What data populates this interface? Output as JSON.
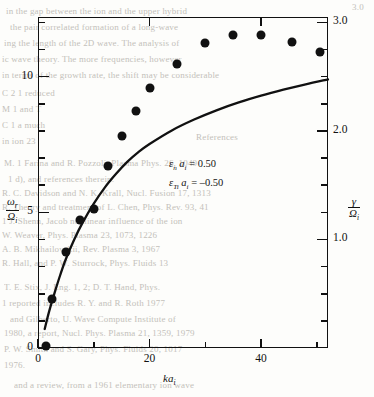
{
  "figure": {
    "background_color": "#fdfdfb",
    "ink_color": "#111111",
    "ghost_color": "#b9b6b0"
  },
  "annotations": {
    "line1": "εₙ aᵢ = 0.50",
    "line1_symbol": "ε",
    "line1_sub": "n",
    "line1_var": "a",
    "line1_var_sub": "i",
    "line1_value": "= 0.50",
    "line2_symbol": "ε",
    "line2_sub": "Ti",
    "line2_var": "a",
    "line2_var_sub": "i",
    "line2_value": "= –0.50"
  },
  "axes": {
    "x": {
      "label_var": "ka",
      "label_sub": "i",
      "label_text": "kaᵢ",
      "min": 0,
      "max": 52,
      "ticks_major": [
        0,
        20,
        40
      ],
      "tick_labels": [
        "0",
        "20",
        "40"
      ],
      "ticks_minor": [
        10,
        30,
        50
      ]
    },
    "y_left": {
      "num": "ω",
      "num_sub": "r",
      "den": "Ω",
      "den_sub": "i",
      "label_text": "ω_r / Ω_i",
      "min": 0,
      "max": 12.2,
      "ticks_major": [
        0,
        5,
        10
      ],
      "tick_labels": [
        "0",
        "5",
        "10"
      ],
      "ticks_minor": [
        1,
        2,
        3,
        4,
        6,
        7,
        8,
        9,
        11,
        12
      ]
    },
    "y_right": {
      "num": "γ",
      "den": "Ω",
      "den_sub": "i",
      "label_text": "γ / Ω_i",
      "min": 0,
      "max": 3.05,
      "ticks_major": [
        1.0,
        2.0,
        3.0
      ],
      "tick_labels": [
        "1.0",
        "2.0",
        "3.0"
      ],
      "ticks_minor": [
        0.25,
        0.5,
        0.75,
        1.25,
        1.5,
        1.75,
        2.25,
        2.5,
        2.75
      ]
    }
  },
  "chart_data": {
    "type": "scatter",
    "title": "",
    "xlabel": "kaᵢ",
    "ylabel": "ω_r / Ω_i",
    "ylabel_right": "γ / Ω_i",
    "xlim": [
      0,
      52
    ],
    "ylim": [
      0,
      12.2
    ],
    "ylim_right": [
      0,
      3.05
    ],
    "grid": false,
    "legend": "none",
    "series": [
      {
        "name": "γ / Ω_i (growth rate, markers)",
        "type": "scatter",
        "axis": "right",
        "marker": "filled-circle",
        "color": "#111111",
        "points": [
          {
            "x": 1.5,
            "y": 0.02
          },
          {
            "x": 2.5,
            "y": 0.45
          },
          {
            "x": 5.0,
            "y": 0.88
          },
          {
            "x": 7.5,
            "y": 1.18
          },
          {
            "x": 10.0,
            "y": 1.28
          },
          {
            "x": 12.5,
            "y": 1.68
          },
          {
            "x": 15.0,
            "y": 1.95
          },
          {
            "x": 17.5,
            "y": 2.18
          },
          {
            "x": 20.0,
            "y": 2.4
          },
          {
            "x": 25.0,
            "y": 2.62
          },
          {
            "x": 30.0,
            "y": 2.81
          },
          {
            "x": 35.0,
            "y": 2.88
          },
          {
            "x": 40.0,
            "y": 2.88
          },
          {
            "x": 45.5,
            "y": 2.82
          },
          {
            "x": 50.5,
            "y": 2.73
          }
        ]
      },
      {
        "name": "ω_r / Ω_i (real frequency, curve)",
        "type": "line",
        "axis": "left",
        "color": "#111111",
        "points": [
          {
            "x": 1.2,
            "y": 0.7
          },
          {
            "x": 2.0,
            "y": 1.35
          },
          {
            "x": 3.0,
            "y": 2.05
          },
          {
            "x": 4.0,
            "y": 2.7
          },
          {
            "x": 5.0,
            "y": 3.28
          },
          {
            "x": 6.5,
            "y": 4.0
          },
          {
            "x": 8.0,
            "y": 4.62
          },
          {
            "x": 10.0,
            "y": 5.32
          },
          {
            "x": 12.0,
            "y": 5.92
          },
          {
            "x": 14.0,
            "y": 6.42
          },
          {
            "x": 16.0,
            "y": 6.86
          },
          {
            "x": 18.0,
            "y": 7.22
          },
          {
            "x": 20.0,
            "y": 7.52
          },
          {
            "x": 24.0,
            "y": 8.02
          },
          {
            "x": 28.0,
            "y": 8.42
          },
          {
            "x": 32.0,
            "y": 8.76
          },
          {
            "x": 36.0,
            "y": 9.05
          },
          {
            "x": 40.0,
            "y": 9.3
          },
          {
            "x": 44.0,
            "y": 9.52
          },
          {
            "x": 48.0,
            "y": 9.72
          },
          {
            "x": 52.0,
            "y": 9.9
          }
        ]
      }
    ]
  },
  "ghost_text": {
    "lines": [
      {
        "t": "in the gap between the ion and the upper hybrid",
        "x": 6,
        "y": 6
      },
      {
        "t": "3.0",
        "x": 352,
        "y": 2
      },
      {
        "t": "the pair correlated formation of a long-wave",
        "x": 10,
        "y": 22
      },
      {
        "t": "ing the length of the 2D wave. The  analysis of",
        "x": 4,
        "y": 38
      },
      {
        "t": "ic wave theory. The more frequencies, however",
        "x": 2,
        "y": 54
      },
      {
        "t": "in terms of the growth rate, the shift may be considerable",
        "x": 2,
        "y": 70
      },
      {
        "t": "C 2 1 reduced",
        "x": 2,
        "y": 88
      },
      {
        "t": "M 1 and T",
        "x": 2,
        "y": 104
      },
      {
        "t": "C 1 a much",
        "x": 2,
        "y": 120
      },
      {
        "t": "in ion 23",
        "x": 2,
        "y": 136
      },
      {
        "t": "References",
        "x": 196,
        "y": 132
      },
      {
        "t": "M. 1 Farina and R. Pozzoli, Plasma Phys. 26, 1049",
        "x": 4,
        "y": 158
      },
      {
        "t": "1 d), and references therein.",
        "x": 8,
        "y": 174
      },
      {
        "t": "R. C. Davidson and N. K. Krall, Nucl. Fusion 17, 1313",
        "x": 2,
        "y": 188
      },
      {
        "t": "R. Theory and treatment of L. Chen, Phys. Rev. 93, 41",
        "x": 2,
        "y": 202
      },
      {
        "t": "1 J. Shenn, Jacob nonlinear influence of the ion",
        "x": 2,
        "y": 216
      },
      {
        "t": "W. Weaver, Phys. Plasma 23, 1073, 1226",
        "x": 2,
        "y": 230
      },
      {
        "t": "A. B. Mikhailovskii, Rev. Plasma 3, 1967",
        "x": 2,
        "y": 244
      },
      {
        "t": "R. Hall, and P. W. Sturrock, Phys. Fluids 13",
        "x": 2,
        "y": 258
      },
      {
        "t": "T. E. Stix, J. Eng. 1, 2; D. T. Hand, Phys.",
        "x": 4,
        "y": 282
      },
      {
        "t": "1 reported includes R. Y. and R. Roth 1977",
        "x": 2,
        "y": 298
      },
      {
        "t": "and Gilberto, U. Wave Compute Institute of",
        "x": 10,
        "y": 314
      },
      {
        "t": "1980, a report, Nucl. Phys. Plasma 21, 1359, 1979",
        "x": 4,
        "y": 328
      },
      {
        "t": "P. W. Smith and S. Gary, Phys. Fluids 20, 1017",
        "x": 4,
        "y": 344
      },
      {
        "t": "1976.",
        "x": 4,
        "y": 360
      },
      {
        "t": "and a review, from a 1961 elementary ion wave",
        "x": 14,
        "y": 380
      }
    ]
  }
}
